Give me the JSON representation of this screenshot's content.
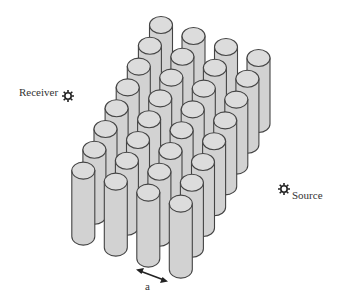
{
  "diagram": {
    "title": "",
    "receiver": {
      "label": "Receiver",
      "icon": "sun-star-icon"
    },
    "source": {
      "label": "Source",
      "icon": "sun-star-icon"
    },
    "lattice": {
      "rows": 8,
      "cols": 4,
      "label": "a",
      "element": "cylinder"
    },
    "colors": {
      "cylinder_fill": "#d2d2d2",
      "cylinder_top": "#dcdcdc",
      "stroke": "#444444",
      "text": "#333333"
    }
  }
}
